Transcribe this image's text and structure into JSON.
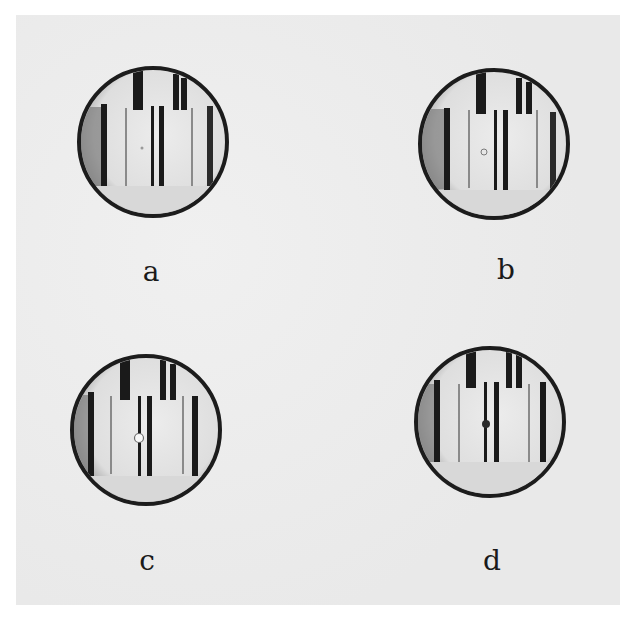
{
  "figure": {
    "panels": [
      {
        "id": "a",
        "label": "a",
        "center_mark": "faint-dot"
      },
      {
        "id": "b",
        "label": "b",
        "center_mark": "small-hollow-dot"
      },
      {
        "id": "c",
        "label": "c",
        "center_mark": "white-hollow-dot"
      },
      {
        "id": "d",
        "label": "d",
        "center_mark": "solid-dark-dot"
      }
    ]
  },
  "colors": {
    "plate": "#ededed",
    "rim": "#1c1c1c",
    "field": "#e4e4e4",
    "lines": "#1a1a1a"
  }
}
